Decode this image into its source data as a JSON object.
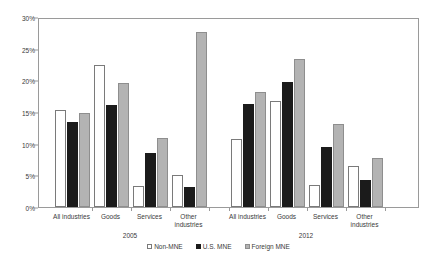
{
  "chart_data": {
    "type": "bar",
    "title": "",
    "subtitle": "",
    "xlabel": "",
    "ylabel": "",
    "ylim": [
      0,
      30
    ],
    "ytick_labels": [
      "0%",
      "5%",
      "10%",
      "15%",
      "20%",
      "25%",
      "30%"
    ],
    "ytick_values": [
      0,
      5,
      10,
      15,
      20,
      25,
      30
    ],
    "grid": false,
    "legend_position": "bottom",
    "groups": [
      "2005",
      "2012"
    ],
    "categories": [
      "All industries",
      "Goods",
      "Services",
      "Other industries"
    ],
    "series": [
      {
        "name": "Non-MNE",
        "color": "#ffffff",
        "values_2005": [
          15.3,
          22.4,
          3.3,
          5.1
        ],
        "values_2012": [
          10.7,
          16.8,
          3.5,
          6.5
        ]
      },
      {
        "name": "U.S. MNE",
        "color": "#1b1b1b",
        "values_2005": [
          13.5,
          16.1,
          8.5,
          3.2
        ],
        "values_2012": [
          16.3,
          19.8,
          9.4,
          4.2
        ]
      },
      {
        "name": "Foreign MNE",
        "color": "#b3b3b3",
        "values_2005": [
          14.9,
          19.6,
          10.9,
          27.7
        ],
        "values_2012": [
          18.2,
          23.4,
          13.1,
          7.8
        ]
      }
    ]
  },
  "axis": {
    "y_ticks": [
      {
        "label": "30%",
        "value": 30
      },
      {
        "label": "25%",
        "value": 25
      },
      {
        "label": "20%",
        "value": 20
      },
      {
        "label": "15%",
        "value": 15
      },
      {
        "label": "10%",
        "value": 10
      },
      {
        "label": "5%",
        "value": 5
      },
      {
        "label": "0%",
        "value": 0
      }
    ]
  },
  "categories_display": [
    {
      "label": "All industries"
    },
    {
      "label": "Goods"
    },
    {
      "label": "Services"
    },
    {
      "label": "Other\nindustries"
    }
  ],
  "period_labels": [
    {
      "label": "2005"
    },
    {
      "label": "2012"
    }
  ],
  "legend": {
    "items": [
      {
        "label": "Non-MNE",
        "swatch": "white-square-icon"
      },
      {
        "label": "U.S. MNE",
        "swatch": "black-square-icon"
      },
      {
        "label": "Foreign MNE",
        "swatch": "gray-square-icon"
      }
    ]
  }
}
